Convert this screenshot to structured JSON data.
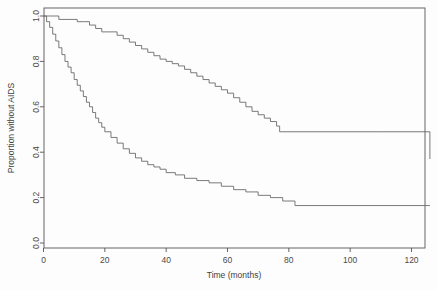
{
  "chart_data": {
    "type": "line",
    "title": "",
    "xlabel": "Time (months)",
    "ylabel": "Proportion without AIDS",
    "xlim": [
      0,
      126
    ],
    "ylim": [
      0,
      1.0
    ],
    "grid": false,
    "legend": "none",
    "xticks": [
      0,
      20,
      40,
      60,
      80,
      100,
      120
    ],
    "xtick_labels": [
      "0",
      "20",
      "40",
      "60",
      "80",
      "100",
      "120"
    ],
    "yticks": [
      0.0,
      0.2,
      0.4,
      0.6,
      0.8,
      1.0
    ],
    "ytick_labels": [
      "0.0",
      "0.2",
      "0.4",
      "0.6",
      "0.8",
      "1.0"
    ],
    "line_color": "#6b6b6b",
    "axis_color": "#555555",
    "background_color": "#fdfdfd",
    "series": [
      {
        "name": "upper-curve",
        "step": "post",
        "x": [
          0,
          2,
          5,
          8,
          11,
          13,
          15,
          17,
          19,
          22,
          24,
          26,
          28,
          30,
          32,
          34,
          36,
          38,
          40,
          42,
          44,
          46,
          48,
          50,
          52,
          54,
          56,
          58,
          60,
          62,
          64,
          66,
          68,
          70,
          72,
          74,
          76,
          77,
          111,
          126
        ],
        "y": [
          1.0,
          1.0,
          0.985,
          0.985,
          0.975,
          0.975,
          0.96,
          0.945,
          0.93,
          0.93,
          0.915,
          0.9,
          0.885,
          0.87,
          0.855,
          0.84,
          0.825,
          0.81,
          0.8,
          0.79,
          0.78,
          0.765,
          0.75,
          0.735,
          0.72,
          0.705,
          0.69,
          0.675,
          0.66,
          0.64,
          0.62,
          0.6,
          0.58,
          0.565,
          0.55,
          0.535,
          0.515,
          0.49,
          0.49,
          0.37
        ]
      },
      {
        "name": "lower-curve",
        "step": "post",
        "x": [
          0,
          1,
          2,
          3,
          4,
          5,
          6,
          7,
          8,
          9,
          10,
          11,
          12,
          13,
          14,
          15,
          16,
          17,
          18,
          19,
          20,
          22,
          24,
          26,
          28,
          30,
          32,
          34,
          36,
          38,
          40,
          43,
          46,
          50,
          54,
          58,
          62,
          66,
          70,
          74,
          78,
          82,
          126
        ],
        "y": [
          1.0,
          0.975,
          0.95,
          0.92,
          0.89,
          0.86,
          0.83,
          0.8,
          0.775,
          0.75,
          0.72,
          0.695,
          0.67,
          0.645,
          0.62,
          0.6,
          0.575,
          0.55,
          0.53,
          0.51,
          0.49,
          0.465,
          0.44,
          0.415,
          0.395,
          0.375,
          0.36,
          0.345,
          0.335,
          0.325,
          0.31,
          0.3,
          0.285,
          0.275,
          0.265,
          0.25,
          0.235,
          0.225,
          0.21,
          0.2,
          0.185,
          0.165,
          0.165
        ]
      }
    ]
  }
}
